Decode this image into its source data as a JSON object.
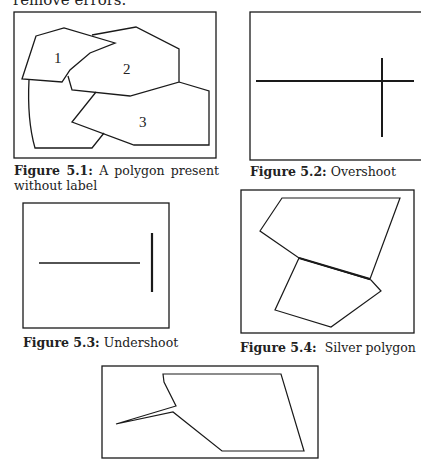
{
  "intro_text": "remove errors.",
  "figures": [
    {
      "id": "5.1",
      "label": "Figure 5.1:",
      "caption": " A polygon present without label",
      "polygon_labels": [
        "1",
        "2",
        "3"
      ]
    },
    {
      "id": "5.2",
      "label": "Figure 5.2:",
      "caption": " Overshoot"
    },
    {
      "id": "5.3",
      "label": "Figure 5.3:",
      "caption": " Undershoot"
    },
    {
      "id": "5.4",
      "label": "Figure 5.4:",
      "caption": "  Silver polygon"
    },
    {
      "id": "5.5",
      "label": "",
      "caption": ""
    }
  ],
  "colors": {
    "stroke": "#1a1a1a",
    "background": "#ffffff"
  }
}
